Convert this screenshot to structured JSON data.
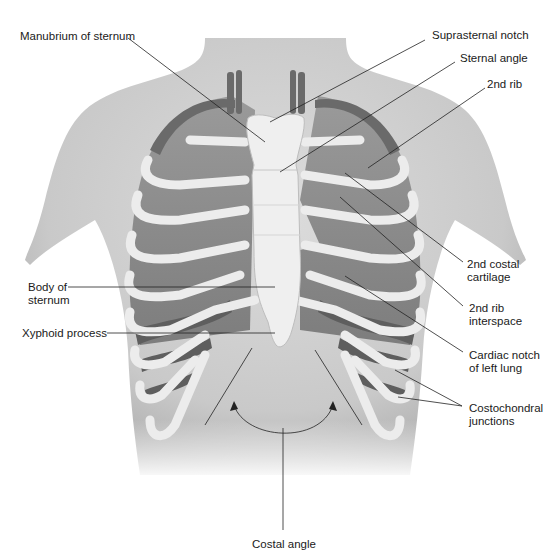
{
  "figure": {
    "colors": {
      "skin": "#cfcfcf",
      "skin_shadow": "#a9a9a9",
      "lung": "#8f8f8f",
      "bone": "#ececec",
      "intercostal": "#5e5e5e",
      "vessel": "#6a6a6a",
      "leader_line": "#222222"
    }
  },
  "labels": {
    "manubrium": [
      "Manubrium of sternum"
    ],
    "suprasternal_notch": [
      "Suprasternal notch"
    ],
    "sternal_angle": [
      "Sternal angle"
    ],
    "second_rib": [
      "2nd rib"
    ],
    "second_costal_cartilage": [
      "2nd costal",
      "cartilage"
    ],
    "second_rib_interspace": [
      "2nd rib",
      "interspace"
    ],
    "cardiac_notch": [
      "Cardiac notch",
      "of left lung"
    ],
    "costochondral_junctions": [
      "Costochondral",
      "junctions"
    ],
    "body_of_sternum": [
      "Body of",
      "sternum"
    ],
    "xyphoid_process": [
      "Xyphoid process"
    ],
    "costal_angle": [
      "Costal angle"
    ]
  }
}
